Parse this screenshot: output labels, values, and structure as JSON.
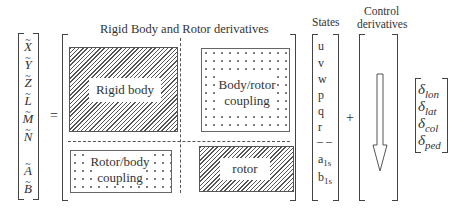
{
  "lhs_vector": {
    "items": [
      {
        "symbol": "X",
        "accent": "~"
      },
      {
        "symbol": "Y",
        "accent": "~"
      },
      {
        "symbol": "Z",
        "accent": "~"
      },
      {
        "symbol": "L",
        "accent": "~"
      },
      {
        "symbol": "M",
        "accent": "~"
      },
      {
        "symbol": "N",
        "accent": "~"
      },
      {
        "symbol": "A",
        "accent": "~"
      },
      {
        "symbol": "B",
        "accent": "~"
      }
    ]
  },
  "operators": {
    "equals": "=",
    "plus": "+"
  },
  "matrix": {
    "title": "Rigid Body and Rotor derivatives",
    "blocks": {
      "rigid_body": "Rigid body",
      "body_rotor_coupling_line1": "Body/rotor",
      "body_rotor_coupling_line2": "coupling",
      "rotor_body_coupling_line1": "Rotor/body",
      "rotor_body_coupling_line2": "coupling",
      "rotor": "rotor"
    }
  },
  "states": {
    "title": "States",
    "items": [
      "u",
      "v",
      "w",
      "p",
      "q",
      "r"
    ],
    "separator": "– –",
    "rotor_items": [
      {
        "base": "a",
        "sub": "1s"
      },
      {
        "base": "b",
        "sub": "1s"
      }
    ]
  },
  "control": {
    "title_line1": "Control",
    "title_line2": "derivatives"
  },
  "control_inputs": {
    "items": [
      {
        "base": "δ",
        "sub": "lon"
      },
      {
        "base": "δ",
        "sub": "lat"
      },
      {
        "base": "δ",
        "sub": "col"
      },
      {
        "base": "δ",
        "sub": "ped"
      }
    ]
  }
}
